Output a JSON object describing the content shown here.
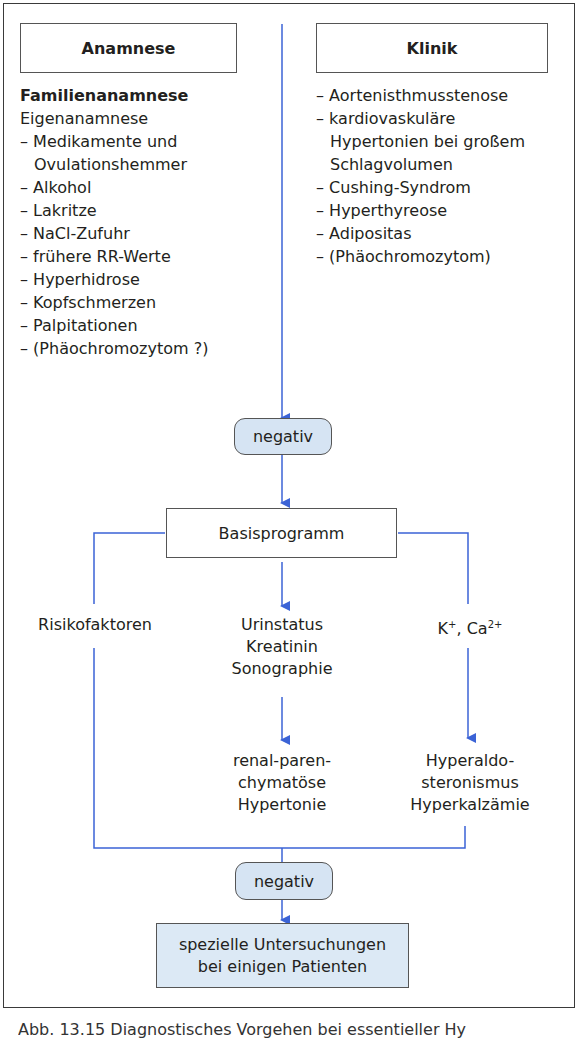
{
  "colors": {
    "arrow": "#3b63d6",
    "pill_fill": "#d6e4f3",
    "final_fill": "#dce9f5"
  },
  "anamnese": {
    "header": "Anamnese",
    "bold_line": "Familienanamnese",
    "sub_line": "Eigenanamnese",
    "items": [
      "Medikamente und Ovulationshemmer",
      "Alkohol",
      "Lakritze",
      "NaCl-Zufuhr",
      "frühere RR-Werte",
      "Hyperhidrose",
      "Kopfschmerzen",
      "Palpitationen",
      "(Phäochromozytom ?)"
    ]
  },
  "klinik": {
    "header": "Klinik",
    "items": [
      "Aortenisthmusstenose",
      "kardiovaskuläre Hypertonien bei großem Schlagvolumen",
      "Cushing-Syndrom",
      "Hyperthyreose",
      "Adipositas",
      "(Phäochromozytom)"
    ]
  },
  "negativ_1": "negativ",
  "basisprogramm": "Basisprogramm",
  "branches": {
    "left": "Risikofaktoren",
    "center_lines": [
      "Urinstatus",
      "Kreatinin",
      "Sonographie"
    ],
    "center_result_lines": [
      "renal-paren-",
      "chymatöse",
      "Hypertonie"
    ],
    "right_k": "K",
    "right_k_sup": "+",
    "right_ca": ", Ca",
    "right_ca_sup": "2+",
    "right_result_lines": [
      "Hyperaldo-",
      "steronismus",
      "Hyperkalzämie"
    ]
  },
  "negativ_2": "negativ",
  "final": {
    "line1": "spezielle Untersuchungen",
    "line2": "bei einigen Patienten"
  },
  "caption": "Abb. 13.15 Diagnostisches Vorgehen bei essentieller Hy"
}
